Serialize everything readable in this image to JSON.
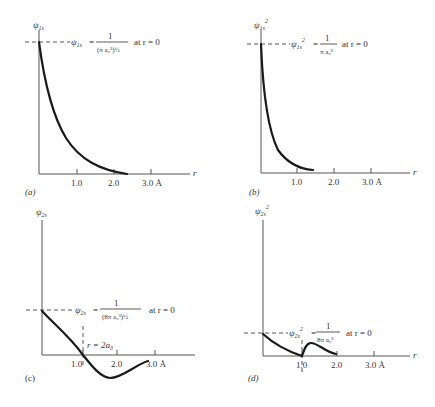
{
  "figure": {
    "panels": [
      {
        "id": "a",
        "panel_label": "(a)",
        "y_label": "ψ",
        "y_label_sub": "1s",
        "y_label_sup": "",
        "x_label": "r",
        "annotation_lhs": "ψ",
        "annotation_lhs_sub": "1s",
        "annotation_lhs_sup": "",
        "annotation_eq": "=",
        "annotation_num": "1",
        "annotation_den": "(π a₀³)½",
        "annotation_cond": "at r = 0",
        "ticks": [
          "1.0",
          "2.0",
          "3.0 Å"
        ]
      },
      {
        "id": "b",
        "panel_label": "(b)",
        "y_label": "ψ",
        "y_label_sub": "1s",
        "y_label_sup": "2",
        "x_label": "r",
        "annotation_lhs": "ψ",
        "annotation_lhs_sub": "1s",
        "annotation_lhs_sup": "2",
        "annotation_eq": "=",
        "annotation_num": "1",
        "annotation_den": "π a₀³",
        "annotation_cond": "at r = 0",
        "ticks": [
          "1.0",
          "2.0",
          "3.0 Å"
        ]
      },
      {
        "id": "c",
        "panel_label": "(c)",
        "y_label": "ψ",
        "y_label_sub": "2s",
        "y_label_sup": "",
        "x_label": "",
        "annotation_lhs": "ψ",
        "annotation_lhs_sub": "2s",
        "annotation_lhs_sup": "",
        "annotation_eq": "=",
        "annotation_num": "1",
        "annotation_den": "(8π a₀³)½",
        "annotation_cond": "at r = 0",
        "node_label": "r = 2a₀",
        "ticks": [
          "1.0",
          "2.0",
          "3.0  Å"
        ]
      },
      {
        "id": "d",
        "panel_label": "(d)",
        "y_label": "ψ",
        "y_label_sub": "2s",
        "y_label_sup": "2",
        "x_label": "r",
        "annotation_lhs": "ψ",
        "annotation_lhs_sub": "2s",
        "annotation_lhs_sup": "2",
        "annotation_eq": "=",
        "annotation_num": "1",
        "annotation_den": "8π a₀³",
        "annotation_cond": "at r = 0",
        "ticks": [
          "1.0",
          "2.0",
          "3.0  Å"
        ]
      }
    ]
  }
}
